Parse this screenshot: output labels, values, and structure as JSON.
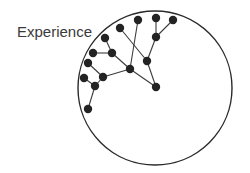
{
  "label": {
    "text": "Experience",
    "x": 17,
    "y": 23
  },
  "colors": {
    "node": "#232323",
    "edge": "#3c3c3c",
    "boundary": "#2a2a2a",
    "background": "#ffffff"
  },
  "boundary_circle": {
    "cx": 155,
    "cy": 88,
    "r": 77
  },
  "node_radius": 4.2,
  "nodes": [
    {
      "id": "n1",
      "x": 138,
      "y": 20
    },
    {
      "id": "n2",
      "x": 156,
      "y": 18
    },
    {
      "id": "n3",
      "x": 173,
      "y": 20
    },
    {
      "id": "n4",
      "x": 120,
      "y": 28
    },
    {
      "id": "n5",
      "x": 156,
      "y": 37
    },
    {
      "id": "n6",
      "x": 105,
      "y": 38
    },
    {
      "id": "n7",
      "x": 93,
      "y": 53
    },
    {
      "id": "n8",
      "x": 112,
      "y": 53
    },
    {
      "id": "n9",
      "x": 147,
      "y": 61
    },
    {
      "id": "n10",
      "x": 88,
      "y": 63
    },
    {
      "id": "n11",
      "x": 130,
      "y": 69
    },
    {
      "id": "n12",
      "x": 84,
      "y": 78
    },
    {
      "id": "n13",
      "x": 103,
      "y": 77
    },
    {
      "id": "n14",
      "x": 95,
      "y": 86
    },
    {
      "id": "n15",
      "x": 156,
      "y": 87
    },
    {
      "id": "n16",
      "x": 88,
      "y": 109
    }
  ],
  "edges": [
    [
      "n2",
      "n5"
    ],
    [
      "n3",
      "n5"
    ],
    [
      "n5",
      "n9"
    ],
    [
      "n4",
      "n9"
    ],
    [
      "n1",
      "n11"
    ],
    [
      "n9",
      "n15"
    ],
    [
      "n11",
      "n15"
    ],
    [
      "n6",
      "n8"
    ],
    [
      "n7",
      "n8"
    ],
    [
      "n8",
      "n11"
    ],
    [
      "n10",
      "n13"
    ],
    [
      "n13",
      "n11"
    ],
    [
      "n12",
      "n14"
    ],
    [
      "n14",
      "n13"
    ],
    [
      "n14",
      "n16"
    ]
  ]
}
